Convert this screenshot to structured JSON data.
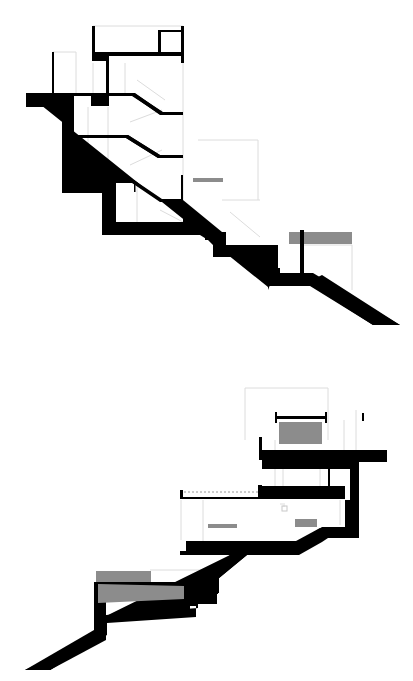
{
  "figure": {
    "type": "architectural-section-drawings",
    "sections": [
      {
        "name": "upper-section",
        "description": "Stepped building section on a descending slope to the right"
      },
      {
        "name": "lower-section",
        "description": "Stepped building section on an ascending slope to the right"
      }
    ]
  },
  "colors": {
    "background": "#ffffff",
    "structure": "#000000",
    "fill_gray": "#8c8c8c",
    "hairline": "#d9d9d9"
  }
}
